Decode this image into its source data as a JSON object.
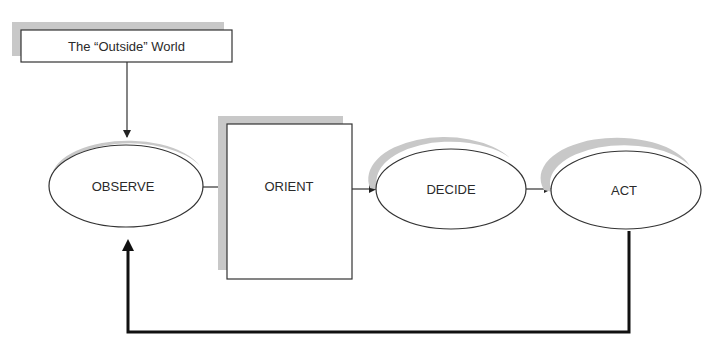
{
  "diagram": {
    "colors": {
      "stroke": "#333333",
      "shadow": "#c8c8c8",
      "fill": "#ffffff",
      "text": "#2a2a2a",
      "feedback": "#111111"
    },
    "nodes": {
      "outside": {
        "label": "The “Outside” World",
        "shape": "rectangle"
      },
      "observe": {
        "label": "OBSERVE",
        "shape": "ellipse"
      },
      "orient": {
        "label": "ORIENT",
        "shape": "rectangle"
      },
      "decide": {
        "label": "DECIDE",
        "shape": "ellipse"
      },
      "act": {
        "label": "ACT",
        "shape": "ellipse"
      }
    },
    "edges": [
      {
        "from": "outside",
        "to": "observe"
      },
      {
        "from": "observe",
        "to": "orient"
      },
      {
        "from": "orient",
        "to": "decide"
      },
      {
        "from": "decide",
        "to": "act"
      },
      {
        "from": "act",
        "to": "observe",
        "type": "feedback"
      }
    ]
  }
}
